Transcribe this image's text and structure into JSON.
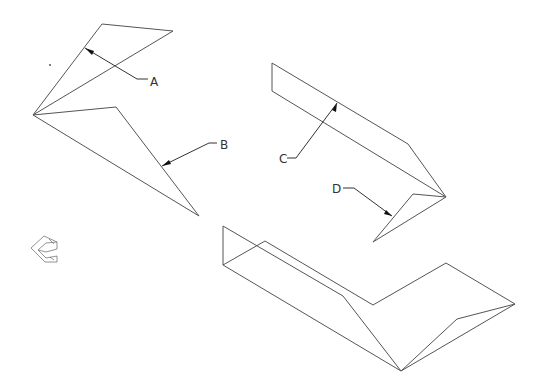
{
  "diagram": {
    "type": "isometric wireframe drawing with callouts",
    "callouts": [
      {
        "label": "A",
        "x": 153,
        "y": 86
      },
      {
        "label": "B",
        "x": 221,
        "y": 149
      },
      {
        "label": "C",
        "x": 280,
        "y": 162
      },
      {
        "label": "D",
        "x": 332,
        "y": 192
      }
    ],
    "colors": {
      "line": "#555555",
      "leader": "#333333",
      "background": "#ffffff"
    },
    "view_icon": "isometric-view-cube-icon"
  }
}
